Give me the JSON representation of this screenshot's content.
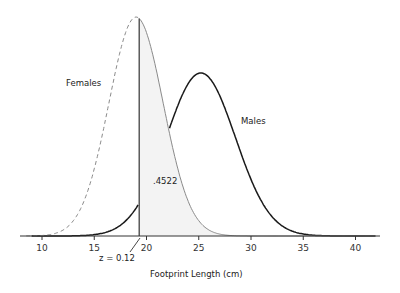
{
  "chart_data": {
    "type": "line",
    "title": "",
    "xlabel": "Footprint Length (cm)",
    "ylabel": "",
    "xlim": [
      8,
      43
    ],
    "x_ticks": [
      10,
      15,
      20,
      25,
      30,
      35,
      40
    ],
    "grid": false,
    "legend": "inline labels",
    "series": [
      {
        "name": "Females",
        "style": "dashed",
        "color": "#999999",
        "mean": 19.0,
        "sd": 2.6
      },
      {
        "name": "Males",
        "style": "solid",
        "color": "#222222",
        "mean": 25.2,
        "sd": 3.3
      }
    ],
    "annotations": [
      {
        "text": ".4522",
        "x": 20.3,
        "description": "shaded area under Females curve to the right of cutoff"
      },
      {
        "text": "z = 0.12",
        "x": 19.3,
        "description": "cutoff line marker"
      }
    ],
    "cutoff_x": 19.3,
    "shaded_region": {
      "series": "Females",
      "from": 19.3,
      "to": 43
    }
  },
  "labels": {
    "females": "Females",
    "males": "Males",
    "area": ".4522",
    "z": "z = 0.12",
    "xlabel": "Footprint Length (cm)",
    "ticks": [
      "10",
      "15",
      "20",
      "25",
      "30",
      "35",
      "40"
    ]
  },
  "colors": {
    "axis": "#333333",
    "females_line": "#8a8a8a",
    "males_line": "#1a1a1a",
    "shade": "#f2f2f2"
  }
}
